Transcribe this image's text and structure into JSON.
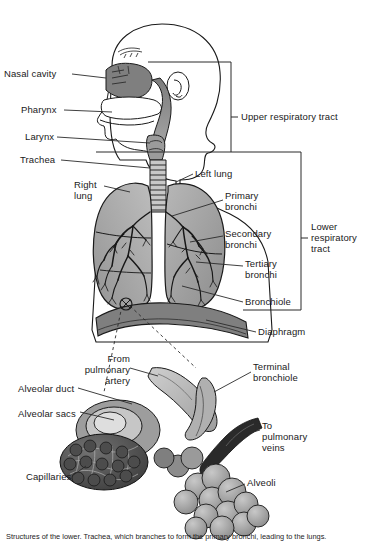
{
  "figure": {
    "style": "grayscale medical illustration",
    "caption": "Structures of the lower. Trachea, which branches to form the primary bronchi, leading to the lungs."
  },
  "palette": {
    "line": "#1a1a1a",
    "body_fill": "#ffffff",
    "tissue_mid": "#8e8e8e",
    "tissue_dark": "#6a6a6a",
    "tissue_light": "#c3c3c3",
    "lung_fill": "#9a9a9a",
    "lung_fill_light": "#b5b5b5",
    "diaphragm": "#7d7d7d",
    "alveoli": "#a2a2a2",
    "vessel": "#b8b8b8",
    "leader": "#2a2a2a",
    "text": "#1a1a1a"
  },
  "brackets": {
    "upper": {
      "label": "Upper respiratory tract",
      "x": 231,
      "y_top": 62,
      "y_bottom": 152,
      "tick_y": 117
    },
    "lower": {
      "label": "Lower respiratory tract",
      "label_lines": [
        "Lower",
        "respiratory",
        "tract"
      ],
      "x": 301,
      "y_top": 152,
      "y_bottom": 310,
      "tick_y": 238
    }
  },
  "labels": {
    "upper_tract": [
      {
        "id": "nasal-cavity",
        "text": "Nasal cavity",
        "x": 4,
        "y": 68,
        "align": "left",
        "leader": {
          "x1": 70,
          "y1": 74,
          "x2": 104,
          "y2": 74
        }
      },
      {
        "id": "pharynx",
        "text": "Pharynx",
        "x": 21,
        "y": 104,
        "align": "left",
        "leader": {
          "x1": 70,
          "y1": 110,
          "x2": 112,
          "y2": 110
        }
      },
      {
        "id": "larynx",
        "text": "Larynx",
        "x": 25,
        "y": 131,
        "align": "left",
        "leader": {
          "x1": 70,
          "y1": 137,
          "x2": 118,
          "y2": 137
        }
      },
      {
        "id": "trachea",
        "text": "Trachea",
        "x": 20,
        "y": 154,
        "align": "left",
        "leader": {
          "x1": 70,
          "y1": 160,
          "x2": 124,
          "y2": 160
        }
      }
    ],
    "lungs": [
      {
        "id": "right-lung",
        "text": "Right\nlung",
        "x": 74,
        "y": 179,
        "align": "left"
      },
      {
        "id": "left-lung",
        "text": "Left lung",
        "x": 195,
        "y": 170,
        "align": "left"
      },
      {
        "id": "primary-bronchi",
        "text": "Primary\nbronchi",
        "x": 225,
        "y": 190,
        "align": "left"
      },
      {
        "id": "secondary-bronchi",
        "text": "Secondary\nbronchi",
        "x": 225,
        "y": 228,
        "align": "left"
      },
      {
        "id": "tertiary-bronchi",
        "text": "Tertiary\nbronchi",
        "x": 245,
        "y": 258,
        "align": "left"
      },
      {
        "id": "bronchiole",
        "text": "Bronchiole",
        "x": 245,
        "y": 297,
        "align": "left"
      },
      {
        "id": "diaphragm",
        "text": "Diaphragm",
        "x": 258,
        "y": 327,
        "align": "left"
      }
    ],
    "alveolar_detail": [
      {
        "id": "from-pulmonary-artery",
        "text": "From\npulmonary\nartery",
        "x": 126,
        "y": 358,
        "align": "right"
      },
      {
        "id": "terminal-bronchiole",
        "text": "Terminal\nbronchiole",
        "x": 253,
        "y": 362,
        "align": "left"
      },
      {
        "id": "alveolar-duct",
        "text": "Alveolar duct",
        "x": 18,
        "y": 384,
        "align": "left"
      },
      {
        "id": "alveolar-sacs",
        "text": "Alveolar sacs",
        "x": 18,
        "y": 409,
        "align": "left"
      },
      {
        "id": "to-pulmonary-veins",
        "text": "To\npulmonary\nveins",
        "x": 262,
        "y": 421,
        "align": "left"
      },
      {
        "id": "capillaries",
        "text": "Capillaries",
        "x": 26,
        "y": 472,
        "align": "left"
      },
      {
        "id": "alveoli",
        "text": "Alveoli",
        "x": 247,
        "y": 477,
        "align": "left"
      }
    ]
  }
}
